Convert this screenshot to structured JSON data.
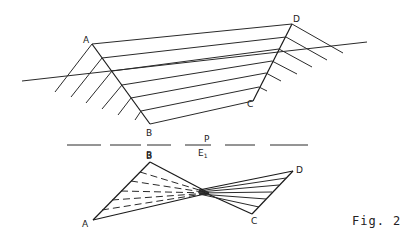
{
  "figure": {
    "caption": "Fig. 2",
    "upper_view": {
      "labels": {
        "A": "A",
        "B": "B",
        "C": "C",
        "D": "D"
      },
      "points": {
        "A": [
          92,
          44
        ],
        "B": [
          150,
          124
        ],
        "C": [
          253,
          101
        ],
        "D": [
          292,
          24
        ]
      },
      "ground_line": [
        [
          22,
          81
        ],
        [
          367,
          42
        ]
      ]
    },
    "separator": {
      "label_top": "P",
      "label_bottom": "E",
      "label_bottom_sub": "1",
      "label_B": "B",
      "y": 145
    },
    "lower_view": {
      "labels": {
        "A": "A",
        "B": "B",
        "C": "C",
        "D": "D"
      },
      "points": {
        "A": [
          93,
          220
        ],
        "B": [
          150,
          162
        ],
        "C": [
          252,
          214
        ],
        "D": [
          293,
          171
        ],
        "X": [
          209,
          193
        ]
      }
    }
  }
}
